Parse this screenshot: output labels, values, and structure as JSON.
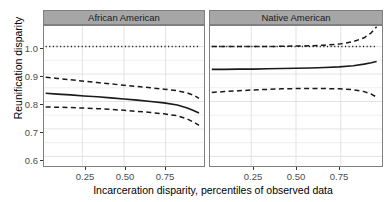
{
  "chart_data": {
    "type": "line",
    "title": "",
    "xlabel": "Incarceration disparity, percentiles of observed data",
    "ylabel": "Reunification disparity",
    "xlim": [
      0.02,
      0.98
    ],
    "ylim": [
      0.565,
      1.075
    ],
    "xticks": [
      0.25,
      0.5,
      0.75
    ],
    "xtick_labels": [
      "0.25",
      "0.50",
      "0.75"
    ],
    "yticks": [
      0.6,
      0.7,
      0.8,
      0.9,
      1.0
    ],
    "ytick_labels": [
      "0.6",
      "0.7",
      "0.8",
      "0.9",
      "1.0"
    ],
    "grid": true,
    "legend": "none",
    "facets": [
      {
        "label": "African American",
        "x": [
          0.03,
          0.1,
          0.18,
          0.26,
          0.34,
          0.42,
          0.5,
          0.58,
          0.66,
          0.74,
          0.82,
          0.88,
          0.92,
          0.95
        ],
        "series": [
          {
            "name": "reference",
            "style": "dotted",
            "values": [
              1.0,
              1.0,
              1.0,
              1.0,
              1.0,
              1.0,
              1.0,
              1.0,
              1.0,
              1.0,
              1.0,
              1.0,
              1.0,
              1.0
            ]
          },
          {
            "name": "upper-confidence-interval",
            "style": "dashed",
            "values": [
              0.888,
              0.884,
              0.879,
              0.874,
              0.869,
              0.864,
              0.859,
              0.855,
              0.85,
              0.845,
              0.839,
              0.831,
              0.822,
              0.811
            ]
          },
          {
            "name": "estimate",
            "style": "solid",
            "values": [
              0.83,
              0.827,
              0.824,
              0.82,
              0.817,
              0.813,
              0.809,
              0.805,
              0.8,
              0.795,
              0.787,
              0.776,
              0.766,
              0.758
            ]
          },
          {
            "name": "lower-confidence-interval",
            "style": "dashed",
            "values": [
              0.78,
              0.779,
              0.778,
              0.776,
              0.774,
              0.771,
              0.768,
              0.764,
              0.76,
              0.755,
              0.748,
              0.736,
              0.724,
              0.713
            ]
          }
        ]
      },
      {
        "label": "Native American",
        "x": [
          0.03,
          0.1,
          0.18,
          0.26,
          0.34,
          0.42,
          0.5,
          0.58,
          0.66,
          0.74,
          0.82,
          0.88,
          0.92,
          0.95
        ],
        "series": [
          {
            "name": "reference",
            "style": "dotted",
            "values": [
              1.0,
              1.0,
              1.0,
              1.0,
              1.0,
              1.0,
              1.0,
              1.0,
              1.0,
              1.0,
              1.0,
              1.0,
              1.0,
              1.0
            ]
          },
          {
            "name": "upper-confidence-interval",
            "style": "dashed",
            "values": [
              1.0,
              1.0,
              1.0,
              1.0,
              1.0,
              1.001,
              1.002,
              1.003,
              1.005,
              1.009,
              1.018,
              1.032,
              1.05,
              1.072
            ]
          },
          {
            "name": "estimate",
            "style": "solid",
            "values": [
              0.917,
              0.917,
              0.918,
              0.918,
              0.919,
              0.92,
              0.921,
              0.922,
              0.924,
              0.926,
              0.93,
              0.936,
              0.941,
              0.946
            ]
          },
          {
            "name": "lower-confidence-interval",
            "style": "dashed",
            "values": [
              0.833,
              0.836,
              0.839,
              0.842,
              0.844,
              0.846,
              0.847,
              0.847,
              0.847,
              0.846,
              0.843,
              0.836,
              0.827,
              0.816
            ]
          }
        ]
      }
    ]
  },
  "axes": {
    "y_title": "Reunification disparity",
    "x_title": "Incarceration disparity, percentiles of observed data",
    "y_labels": [
      "1.0",
      "0.9",
      "0.8",
      "0.7",
      "0.6"
    ],
    "x_labels": [
      "0.25",
      "0.50",
      "0.75"
    ]
  },
  "facet_labels": [
    "African American",
    "Native American"
  ],
  "colors": {
    "strip_fill": "#a6a6a6",
    "strip_border": "#7f7f7f",
    "panel_border": "#808080",
    "line": "#1a1a1a",
    "grid": "#e8e8e8",
    "tick_text": "#4d4d4d",
    "background": "#ffffff"
  }
}
